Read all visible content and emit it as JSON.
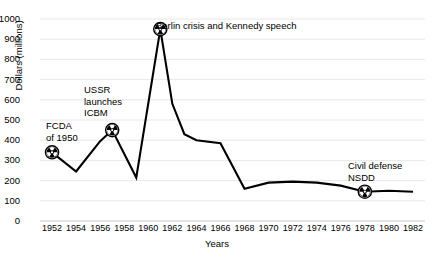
{
  "chart_data": {
    "type": "line",
    "title": "",
    "xlabel": "Years",
    "ylabel": "Dollars (millions)",
    "xlim": [
      1951,
      1983
    ],
    "ylim": [
      0,
      1000
    ],
    "grid": true,
    "legend": false,
    "x_ticks": [
      1952,
      1954,
      1956,
      1958,
      1960,
      1962,
      1964,
      1966,
      1968,
      1970,
      1972,
      1974,
      1976,
      1978,
      1980,
      1982
    ],
    "y_ticks": [
      0,
      100,
      200,
      300,
      400,
      500,
      600,
      700,
      800,
      900,
      1000
    ],
    "series": [
      {
        "name": "Civil defense funding",
        "x": [
          1952,
          1954,
          1956,
          1957,
          1959,
          1961,
          1962,
          1963,
          1964,
          1966,
          1968,
          1970,
          1972,
          1974,
          1976,
          1978,
          1980,
          1982
        ],
        "values": [
          340,
          245,
          395,
          450,
          215,
          950,
          580,
          430,
          400,
          385,
          160,
          190,
          195,
          190,
          175,
          145,
          150,
          145
        ]
      }
    ],
    "annotations": [
      {
        "label": "FCDA\nof 1950",
        "x": 1952,
        "y": 340,
        "marker": "radiation-symbol"
      },
      {
        "label": "USSR\nlaunches\nICBM",
        "x": 1957,
        "y": 450,
        "marker": "radiation-symbol"
      },
      {
        "label": "Berlin crisis and Kennedy speech",
        "x": 1961,
        "y": 950,
        "marker": "radiation-symbol"
      },
      {
        "label": "Civil defense\nNSDD",
        "x": 1978,
        "y": 145,
        "marker": "radiation-symbol"
      }
    ],
    "colors": {
      "line": "#000000",
      "grid": "#e8e8e8",
      "axis": "#c8c8c8",
      "marker": "#000000",
      "background": "#ffffff"
    }
  }
}
